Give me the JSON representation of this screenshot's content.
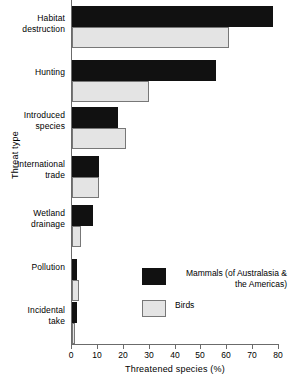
{
  "chart_data": {
    "type": "bar",
    "orientation": "horizontal",
    "title": "",
    "xlabel": "Threatened species (%)",
    "ylabel": "Threat type",
    "xlim": [
      0,
      80
    ],
    "xticks": [
      0,
      10,
      20,
      30,
      40,
      50,
      60,
      70,
      80
    ],
    "xtick_labels": [
      "0",
      "10",
      "20",
      "30",
      "40",
      "50",
      "60",
      "70",
      "80"
    ],
    "grid": false,
    "legend_position": "center-right",
    "categories": [
      "Habitat destruction",
      "Hunting",
      "Introduced species",
      "International trade",
      "Wetland drainage",
      "Pollution",
      "Incidental take"
    ],
    "category_lines": [
      [
        "Habitat",
        "destruction"
      ],
      [
        "Hunting"
      ],
      [
        "Introduced",
        "species"
      ],
      [
        "International",
        "trade"
      ],
      [
        "Wetland",
        "drainage"
      ],
      [
        "Pollution"
      ],
      [
        "Incidental",
        "take"
      ]
    ],
    "series": [
      {
        "name": "Mammals (of Australasia & the Americas)",
        "name_lines": [
          "Mammals (of Australasia &",
          "the Americas)"
        ],
        "color": "#111111",
        "values": [
          78,
          56,
          18,
          10.5,
          8,
          2,
          2
        ]
      },
      {
        "name": "Birds",
        "name_lines": [
          "Birds"
        ],
        "color": "#e4e4e4",
        "values": [
          61,
          30,
          21,
          10.5,
          3.5,
          2.8,
          1
        ]
      }
    ]
  },
  "legend": {
    "items": [
      {
        "label_line1": "Mammals (of Australasia &",
        "label_line2": "the Americas)",
        "swatch": "mammals"
      },
      {
        "label_line1": "Birds",
        "label_line2": "",
        "swatch": "birds"
      }
    ]
  },
  "axes": {
    "x_title": "Threatened species (%)",
    "y_title": "Threat type",
    "x_tick_0": "0",
    "x_tick_1": "10",
    "x_tick_2": "20",
    "x_tick_3": "30",
    "x_tick_4": "40",
    "x_tick_5": "50",
    "x_tick_6": "60",
    "x_tick_7": "70",
    "x_tick_8": "80"
  },
  "categories_text": {
    "c0_l1": "Habitat",
    "c0_l2": "destruction",
    "c1_l1": "Hunting",
    "c1_l2": "",
    "c2_l1": "Introduced",
    "c2_l2": "species",
    "c3_l1": "International",
    "c3_l2": "trade",
    "c4_l1": "Wetland",
    "c4_l2": "drainage",
    "c5_l1": "Pollution",
    "c5_l2": "",
    "c6_l1": "Incidental",
    "c6_l2": "take"
  }
}
